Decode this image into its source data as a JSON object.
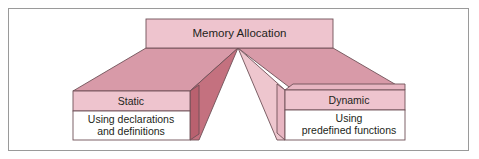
{
  "diagram": {
    "title": "Memory Allocation",
    "type": "hierarchy-funnel",
    "root": {
      "id": "memory-allocation",
      "label": "Memory Allocation"
    },
    "branches": [
      {
        "id": "static",
        "heading": "Static",
        "body": "Using  declarations\nand definitions"
      },
      {
        "id": "dynamic",
        "heading": "Dynamic",
        "body": "Using\npredefined functions"
      }
    ]
  },
  "colors": {
    "page_background": "#ffffff",
    "frame_border": "#9a9a9a",
    "box_fill_light": "#eec4ce",
    "box_fill_body": "#ffffff",
    "wing_fill": "#d89aa8",
    "wing_fill_right": "#d89aa8",
    "center_dark": "#c4717f",
    "center_light": "#eec6ce",
    "side_face_dark": "#b9616f",
    "side_face_light": "#e8b6c2",
    "outline": "#6f5158",
    "text": "#231f20"
  }
}
